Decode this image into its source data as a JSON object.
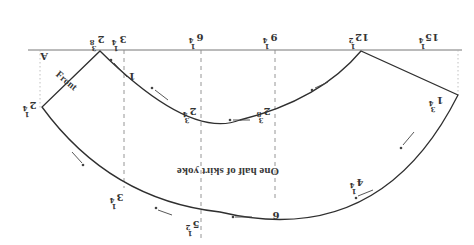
{
  "diagram": {
    "title": "One half of skirt yoke",
    "front_label": "Front",
    "corner_label": "A",
    "colors": {
      "line": "#2f2f2f",
      "guide": "#8a8a8a",
      "text": "#333333",
      "background": "#ffffff"
    },
    "top_scale": [
      {
        "id": "2-3/8",
        "whole": "2",
        "num": "3",
        "den": "8"
      },
      {
        "id": "3-1/4",
        "whole": "3",
        "num": "1",
        "den": "4"
      },
      {
        "id": "6-1/4",
        "whole": "6",
        "num": "1",
        "den": "4"
      },
      {
        "id": "9-1/4",
        "whole": "9",
        "num": "1",
        "den": "4"
      },
      {
        "id": "12-1/2",
        "whole": "12",
        "num": "1",
        "den": "2"
      },
      {
        "id": "15-1/4",
        "whole": "15",
        "num": "1",
        "den": "4"
      }
    ],
    "side_marks": [
      {
        "id": "2-1/4-left",
        "whole": "2",
        "num": "1",
        "den": "4"
      },
      {
        "id": "1-3/4-right",
        "whole": "1",
        "num": "3",
        "den": "4"
      }
    ],
    "inner_curve_marks": [
      {
        "id": "1-inner-left",
        "text": "1"
      },
      {
        "id": "2-3/4-inner",
        "whole": "2",
        "num": "3",
        "den": "4"
      },
      {
        "id": "2-3/8-inner",
        "whole": "2",
        "num": "3",
        "den": "8"
      }
    ],
    "outer_curve_marks": [
      {
        "id": "3-1/4-outer",
        "whole": "3",
        "num": "1",
        "den": "4"
      },
      {
        "id": "5-1/2-outer",
        "whole": "5",
        "num": "1",
        "den": "2"
      },
      {
        "id": "6-outer",
        "text": "6"
      },
      {
        "id": "4-1/4-outer",
        "whole": "4",
        "num": "1",
        "den": "4"
      }
    ]
  }
}
